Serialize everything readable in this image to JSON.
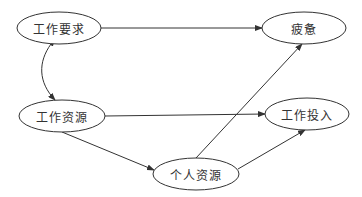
{
  "diagram": {
    "nodes": [
      {
        "id": "job_demands",
        "label": "工作要求",
        "cx": 59,
        "cy": 28,
        "rx": 42,
        "ry": 16
      },
      {
        "id": "job_resources",
        "label": "工作资源",
        "cx": 62,
        "cy": 116,
        "rx": 43,
        "ry": 16
      },
      {
        "id": "personal_resources",
        "label": "个人资源",
        "cx": 196,
        "cy": 174,
        "rx": 43,
        "ry": 16
      },
      {
        "id": "exhaustion",
        "label": "疲惫",
        "cx": 304,
        "cy": 28,
        "rx": 42,
        "ry": 16
      },
      {
        "id": "work_engagement",
        "label": "工作投入",
        "cx": 307,
        "cy": 114,
        "rx": 42,
        "ry": 16
      }
    ],
    "edges": [
      {
        "from": "job_demands",
        "to": "exhaustion",
        "type": "directed"
      },
      {
        "from": "job_demands",
        "to": "job_resources",
        "type": "bidirectional-curved"
      },
      {
        "from": "job_resources",
        "to": "work_engagement",
        "type": "directed"
      },
      {
        "from": "job_resources",
        "to": "personal_resources",
        "type": "directed"
      },
      {
        "from": "personal_resources",
        "to": "exhaustion",
        "type": "directed"
      },
      {
        "from": "personal_resources",
        "to": "work_engagement",
        "type": "directed"
      }
    ],
    "colors": {
      "stroke": "#333333",
      "background": "#ffffff"
    }
  }
}
